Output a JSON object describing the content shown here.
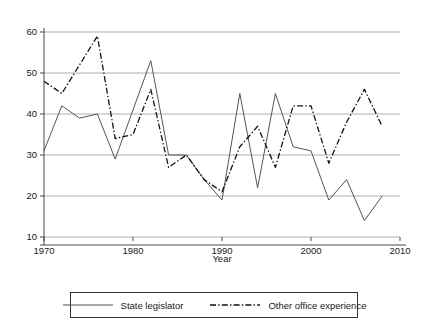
{
  "chart_data": {
    "type": "line",
    "title": "",
    "xlabel": "Year",
    "ylabel": "",
    "xlim": [
      1970,
      2010
    ],
    "ylim": [
      10,
      60
    ],
    "grid": true,
    "xticks": [
      1970,
      1980,
      1990,
      2000,
      2010
    ],
    "yticks": [
      10,
      20,
      30,
      40,
      50,
      60
    ],
    "xtick_labels": [
      "1970",
      "1980",
      "1990",
      "2000",
      "2010"
    ],
    "ytick_labels": [
      "10",
      "20",
      "30",
      "40",
      "50",
      "60"
    ],
    "legend_position": "bottom",
    "x": [
      1970,
      1972,
      1974,
      1976,
      1978,
      1980,
      1982,
      1984,
      1986,
      1988,
      1990,
      1992,
      1994,
      1996,
      1998,
      2000,
      2002,
      2004,
      2006,
      2008
    ],
    "series": [
      {
        "name": "State legislator",
        "style": "solid",
        "color": "#555555",
        "values": [
          31,
          42,
          39,
          40,
          29,
          41,
          53,
          30,
          30,
          24,
          19,
          45,
          22,
          45,
          32,
          31,
          19,
          24,
          14,
          20
        ]
      },
      {
        "name": "Other office experience",
        "style": "dash-dot",
        "color": "#111111",
        "values": [
          48,
          45,
          52,
          59,
          34,
          35,
          46,
          27,
          30,
          24,
          21,
          32,
          37,
          27,
          42,
          42,
          28,
          38,
          46,
          37
        ]
      }
    ]
  },
  "legend": {
    "items": [
      {
        "label": "State legislator",
        "style": "solid"
      },
      {
        "label": "Other office experience",
        "style": "dash-dot"
      }
    ]
  },
  "axis": {
    "x_title": "Year"
  }
}
